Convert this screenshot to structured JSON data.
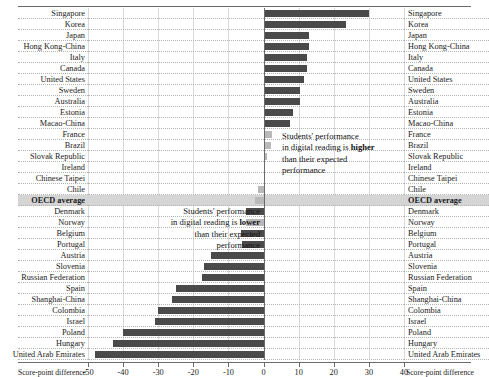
{
  "chart_data": {
    "type": "bar",
    "orientation": "horizontal",
    "title": "",
    "xlabel": "Score-point difference",
    "ylabel": "",
    "xlim": [
      -50,
      40
    ],
    "xticks": [
      -50,
      -40,
      -30,
      -20,
      -10,
      0,
      10,
      20,
      30,
      40
    ],
    "xticklabels": [
      "-50",
      "-40",
      "-30",
      "-20",
      "-10",
      "0",
      "10",
      "20",
      "30",
      "40"
    ],
    "grid": true,
    "legend": null,
    "categories": [
      "Singapore",
      "Korea",
      "Japan",
      "Hong Kong-China",
      "Italy",
      "Canada",
      "United States",
      "Sweden",
      "Australia",
      "Estonia",
      "Macao-China",
      "France",
      "Brazil",
      "Slovak Republic",
      "Ireland",
      "Chinese Taipei",
      "Chile",
      "OECD average",
      "Denmark",
      "Norway",
      "Belgium",
      "Portugal",
      "Austria",
      "Slovenia",
      "Russian Federation",
      "Spain",
      "Shanghai-China",
      "Colombia",
      "Israel",
      "Poland",
      "Hungary",
      "United Arab Emirates"
    ],
    "values": [
      30,
      23.5,
      13,
      13,
      12.5,
      12.5,
      11.5,
      10.5,
      10.5,
      8.5,
      7.5,
      2.5,
      2,
      1,
      0.5,
      0.5,
      -1.5,
      -2.5,
      -5,
      -5,
      -6.5,
      -6,
      -15,
      -17,
      -17.5,
      -25,
      -26,
      -30,
      -31,
      -40,
      -43,
      -48
    ],
    "significance": [
      "significant",
      "significant",
      "significant",
      "significant",
      "significant",
      "significant",
      "significant",
      "significant",
      "significant",
      "significant",
      "significant",
      "not-significant",
      "not-significant",
      "not-significant",
      "not-significant",
      "not-significant",
      "not-significant",
      "not-significant",
      "significant",
      "not-significant",
      "significant",
      "significant",
      "significant",
      "significant",
      "significant",
      "significant",
      "significant",
      "significant",
      "significant",
      "significant",
      "significant",
      "significant"
    ],
    "highlight_category": "OECD average",
    "colors": {
      "significant": "#4a4a4a",
      "not_significant": "#b9b9b9",
      "highlight_row": "#d5d5d5",
      "axis": "#6b6b6b",
      "gridline": "#d9d9d9"
    }
  },
  "annotations": {
    "higher": {
      "line1": "Students' performance",
      "line2_a": "in digital reading is ",
      "line2_b": "higher",
      "line3": "than their expected",
      "line4": "performance"
    },
    "lower": {
      "line1": "Students' performance",
      "line2_a": "in digital reading is ",
      "line2_b": "lower",
      "line3": "than their expected",
      "line4": "performance"
    }
  },
  "axis": {
    "caption_left": "Score-point difference",
    "caption_right": "Score-point difference"
  }
}
